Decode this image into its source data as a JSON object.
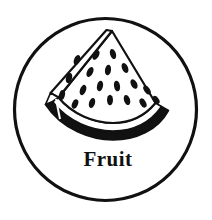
{
  "badge": {
    "label": "Fruit",
    "icon_name": "watermelon-slice-icon",
    "shape": "circle",
    "colors": {
      "background": "#ffffff",
      "outline": "#111111",
      "rind_dark": "#111111",
      "flesh": "#ffffff",
      "seed": "#111111",
      "label_color": "#111111"
    },
    "circle": {
      "cx": 105.5,
      "cy": 109.5,
      "r": 91,
      "stroke_width": 3.2
    },
    "label_position": {
      "x": 108,
      "y": 166
    },
    "watermelon": {
      "apex": {
        "x": 112,
        "y": 31
      },
      "seed_count": 19,
      "seeds": [
        {
          "cx": 77,
          "cy": 60,
          "rx": 3.0,
          "ry": 5.2,
          "angle": 22
        },
        {
          "cx": 69,
          "cy": 78,
          "rx": 3.0,
          "ry": 5.2,
          "angle": 18
        },
        {
          "cx": 62,
          "cy": 95,
          "rx": 2.9,
          "ry": 5.0,
          "angle": 14
        },
        {
          "cx": 96,
          "cy": 55,
          "rx": 2.9,
          "ry": 5.2,
          "angle": 30
        },
        {
          "cx": 113,
          "cy": 54,
          "rx": 2.9,
          "ry": 5.2,
          "angle": -18
        },
        {
          "cx": 90,
          "cy": 72,
          "rx": 3.0,
          "ry": 5.4,
          "angle": 26
        },
        {
          "cx": 108,
          "cy": 70,
          "rx": 3.0,
          "ry": 5.4,
          "angle": 8
        },
        {
          "cx": 125,
          "cy": 68,
          "rx": 3.0,
          "ry": 5.2,
          "angle": -24
        },
        {
          "cx": 83,
          "cy": 90,
          "rx": 3.0,
          "ry": 5.4,
          "angle": 20
        },
        {
          "cx": 100,
          "cy": 86,
          "rx": 3.0,
          "ry": 5.4,
          "angle": 12
        },
        {
          "cx": 117,
          "cy": 86,
          "rx": 3.0,
          "ry": 5.4,
          "angle": -10
        },
        {
          "cx": 134,
          "cy": 84,
          "rx": 3.0,
          "ry": 5.2,
          "angle": -28
        },
        {
          "cx": 147,
          "cy": 90,
          "rx": 2.9,
          "ry": 5.0,
          "angle": -34
        },
        {
          "cx": 75,
          "cy": 104,
          "rx": 2.9,
          "ry": 4.8,
          "angle": 24
        },
        {
          "cx": 92,
          "cy": 103,
          "rx": 3.0,
          "ry": 5.2,
          "angle": 16
        },
        {
          "cx": 110,
          "cy": 100,
          "rx": 3.0,
          "ry": 5.2,
          "angle": 0
        },
        {
          "cx": 127,
          "cy": 100,
          "rx": 3.0,
          "ry": 5.2,
          "angle": -18
        },
        {
          "cx": 143,
          "cy": 103,
          "rx": 2.9,
          "ry": 5.0,
          "angle": -30
        },
        {
          "cx": 156,
          "cy": 100,
          "rx": 2.8,
          "ry": 4.6,
          "angle": -38
        }
      ]
    }
  }
}
